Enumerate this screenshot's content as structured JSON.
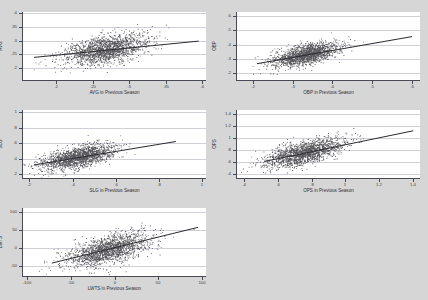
{
  "figure": {
    "background_color": "#d6d6d6",
    "panel_background_color": "#ffffff",
    "point_color": "#3c3c42",
    "line_color": "#2a2a30",
    "axis_color": "#4a4a55",
    "grid_color": "#d0d0d8"
  },
  "chart_data": [
    {
      "type": "scatter",
      "id": "avg",
      "title": "",
      "xlabel": "AVG in Previous Season",
      "ylabel": "AVG",
      "xlim": [
        0.155,
        0.405
      ],
      "ylim": [
        0.155,
        0.405
      ],
      "xticks": [
        0.2,
        0.25,
        0.3,
        0.35,
        0.4
      ],
      "xticklabels": [
        ".2",
        ".25",
        ".3",
        ".35",
        ".4"
      ],
      "yticks": [
        0.2,
        0.25,
        0.3,
        0.35,
        0.4
      ],
      "yticklabels": [
        ".2",
        ".25",
        ".3",
        ".35",
        ".4"
      ],
      "grid": true,
      "n_points": 1800,
      "cloud": {
        "x_mean": 0.268,
        "x_sd": 0.027,
        "y_mean": 0.268,
        "y_sd": 0.027,
        "correlation": 0.46
      },
      "fit_line": {
        "x0": 0.17,
        "y0": 0.238,
        "x1": 0.395,
        "y1": 0.298
      }
    },
    {
      "type": "scatter",
      "id": "obp",
      "title": "",
      "xlabel": "OBP in Previous Season",
      "ylabel": "OBP",
      "xlim": [
        0.16,
        0.62
      ],
      "ylim": [
        0.155,
        0.625
      ],
      "xticks": [
        0.2,
        0.3,
        0.4,
        0.5,
        0.6
      ],
      "xticklabels": [
        ".2",
        ".3",
        ".4",
        ".5",
        ".6"
      ],
      "yticks": [
        0.2,
        0.3,
        0.4,
        0.5,
        0.6
      ],
      "yticklabels": [
        ".2",
        ".3",
        ".4",
        ".5",
        ".6"
      ],
      "grid": true,
      "n_points": 1800,
      "cloud": {
        "x_mean": 0.333,
        "x_sd": 0.04,
        "y_mean": 0.333,
        "y_sd": 0.04,
        "correlation": 0.58
      },
      "fit_line": {
        "x0": 0.21,
        "y0": 0.268,
        "x1": 0.6,
        "y1": 0.455
      }
    },
    {
      "type": "scatter",
      "id": "slg",
      "title": "",
      "xlabel": "SLG in Previous Season",
      "ylabel": "SLG",
      "xlim": [
        0.17,
        1.02
      ],
      "ylim": [
        0.15,
        1.03
      ],
      "xticks": [
        0.2,
        0.4,
        0.6,
        0.8,
        1.0
      ],
      "xticklabels": [
        ".2",
        ".4",
        ".6",
        ".8",
        "1"
      ],
      "yticks": [
        0.2,
        0.4,
        0.6,
        0.8,
        1.0
      ],
      "yticklabels": [
        ".2",
        ".4",
        ".6",
        ".8",
        "1"
      ],
      "grid": true,
      "n_points": 1800,
      "cloud": {
        "x_mean": 0.425,
        "x_sd": 0.082,
        "y_mean": 0.425,
        "y_sd": 0.082,
        "correlation": 0.6
      },
      "fit_line": {
        "x0": 0.22,
        "y0": 0.318,
        "x1": 0.88,
        "y1": 0.622
      }
    },
    {
      "type": "scatter",
      "id": "ops",
      "title": "",
      "xlabel": "OPS in Previous Season",
      "ylabel": "OPS",
      "xlim": [
        0.36,
        1.44
      ],
      "ylim": [
        0.34,
        1.46
      ],
      "xticks": [
        0.4,
        0.6,
        0.8,
        1.0,
        1.2,
        1.4
      ],
      "xticklabels": [
        ".4",
        ".6",
        ".8",
        "1",
        "1.2",
        "1.4"
      ],
      "yticks": [
        0.4,
        0.6,
        0.8,
        1.0,
        1.2,
        1.4
      ],
      "yticklabels": [
        ".4",
        ".6",
        ".8",
        "1",
        "1.2",
        "1.4"
      ],
      "grid": true,
      "n_points": 1800,
      "cloud": {
        "x_mean": 0.757,
        "x_sd": 0.115,
        "y_mean": 0.757,
        "y_sd": 0.115,
        "correlation": 0.63
      },
      "fit_line": {
        "x0": 0.52,
        "y0": 0.612,
        "x1": 1.4,
        "y1": 1.118
      }
    },
    {
      "type": "scatter",
      "id": "lwts",
      "title": "",
      "xlabel": "LWTS in Previous Season",
      "ylabel": "LWTS",
      "xlim": [
        -105,
        105
      ],
      "ylim": [
        -78,
        112
      ],
      "xticks": [
        -100,
        -50,
        0,
        50,
        100
      ],
      "xticklabels": [
        "-100",
        "-50",
        "0",
        "50",
        "100"
      ],
      "yticks": [
        -50,
        0,
        50,
        100
      ],
      "yticklabels": [
        "-50",
        "0",
        "50",
        "100"
      ],
      "grid": true,
      "n_points": 1800,
      "cloud": {
        "x_mean": -8,
        "x_sd": 24,
        "y_mean": -4,
        "y_sd": 24,
        "correlation": 0.58
      },
      "fit_line": {
        "x0": -72,
        "y0": -42,
        "x1": 96,
        "y1": 58
      }
    }
  ]
}
